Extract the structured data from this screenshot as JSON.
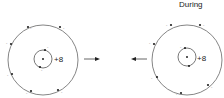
{
  "diagram": {
    "title_right": "During",
    "atoms": [
      {
        "name": "left-atom",
        "nucleus_charge": "+8",
        "outer_electron_count": 6,
        "inner_electron_count": 2,
        "electron_label": "-"
      },
      {
        "name": "right-atom",
        "nucleus_charge": "+8",
        "outer_electron_count": 6,
        "inner_electron_count": 2,
        "electron_label": "-"
      }
    ],
    "arrows": [
      {
        "direction": "right"
      },
      {
        "direction": "left"
      }
    ],
    "colors": {
      "line": "#555555",
      "dot": "#222222",
      "text": "#222222"
    }
  }
}
